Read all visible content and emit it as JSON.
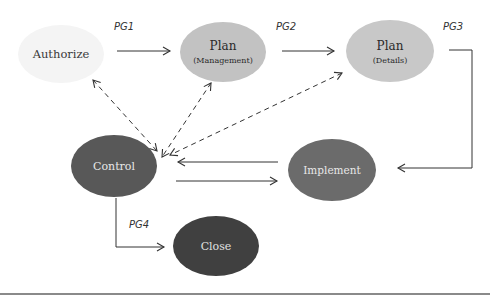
{
  "nodes": [
    {
      "id": "authorize",
      "label": "Authorize",
      "sublabel": "",
      "fill": "#f4f4f4",
      "text_color": "#3a3a3a"
    },
    {
      "id": "plan-management",
      "label": "Plan",
      "sublabel": "(Management)",
      "fill": "#c2c2c2",
      "text_color": "#2a2a2a"
    },
    {
      "id": "plan-details",
      "label": "Plan",
      "sublabel": "(Details)",
      "fill": "#c8c8c8",
      "text_color": "#2a2a2a"
    },
    {
      "id": "control",
      "label": "Control",
      "sublabel": "",
      "fill": "#585858",
      "text_color": "#e8e8e8"
    },
    {
      "id": "implement",
      "label": "Implement",
      "sublabel": "",
      "fill": "#6b6b6b",
      "text_color": "#e8e8e8"
    },
    {
      "id": "close",
      "label": "Close",
      "sublabel": "",
      "fill": "#404040",
      "text_color": "#e0e0e0"
    }
  ],
  "edge_labels": {
    "pg1": "PG1",
    "pg2": "PG2",
    "pg3": "PG3",
    "pg4": "PG4"
  },
  "colors": {
    "line": "#333333",
    "rule": "#8a8a8a"
  }
}
